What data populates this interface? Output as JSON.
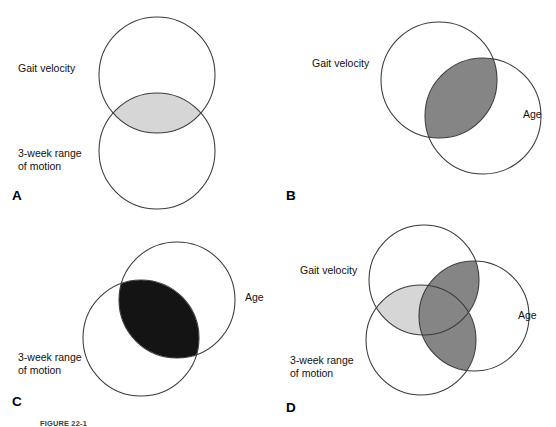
{
  "figure": {
    "caption": "FIGURE 22-1",
    "background_color": "#ffffff",
    "stroke_color": "#3a3a3a"
  },
  "labels": {
    "gait_velocity": "Gait velocity",
    "three_week_rom_line1": "3-week range",
    "three_week_rom_line2": "of motion",
    "age": "Age"
  },
  "colors": {
    "light_gray": "#d6d6d6",
    "medium_gray": "#858585",
    "black": "#141414",
    "outline": "#3a3a3a"
  },
  "panels": [
    {
      "id": "A",
      "letter": "A",
      "letter_x": 12,
      "letter_y": 200,
      "circles": [
        {
          "name": "gait-velocity-circle",
          "cx": 157,
          "cy": 75,
          "r": 58
        },
        {
          "name": "three-week-rom-circle",
          "cx": 157,
          "cy": 151,
          "r": 58
        }
      ],
      "shaded": [
        {
          "name": "gait-rom-intersection",
          "fill": "#d6d6d6"
        }
      ],
      "texts": [
        {
          "name": "gait-velocity-label",
          "key": "gait_velocity",
          "x": 18,
          "y": 72,
          "anchor": "start"
        },
        {
          "name": "three-week-rom-label-line1",
          "key": "three_week_rom_line1",
          "x": 18,
          "y": 157,
          "anchor": "start"
        },
        {
          "name": "three-week-rom-label-line2",
          "key": "three_week_rom_line2",
          "x": 18,
          "y": 170,
          "anchor": "start"
        }
      ]
    },
    {
      "id": "B",
      "letter": "B",
      "letter_x": 8,
      "letter_y": 200,
      "circles": [
        {
          "name": "gait-velocity-circle",
          "cx": 161,
          "cy": 80,
          "r": 58
        },
        {
          "name": "age-circle",
          "cx": 205,
          "cy": 116,
          "r": 58
        }
      ],
      "shaded": [
        {
          "name": "gait-age-intersection",
          "fill": "#858585"
        }
      ],
      "texts": [
        {
          "name": "gait-velocity-label",
          "key": "gait_velocity",
          "x": 34,
          "y": 67,
          "anchor": "start"
        },
        {
          "name": "age-label",
          "key": "age",
          "x": 245,
          "y": 118,
          "anchor": "start"
        }
      ]
    },
    {
      "id": "C",
      "letter": "C",
      "letter_x": 12,
      "letter_y": 193,
      "circles": [
        {
          "name": "age-circle",
          "cx": 177,
          "cy": 87,
          "r": 58
        },
        {
          "name": "three-week-rom-circle",
          "cx": 141,
          "cy": 125,
          "r": 58
        }
      ],
      "shaded": [
        {
          "name": "age-rom-intersection",
          "fill": "#141414"
        }
      ],
      "texts": [
        {
          "name": "age-label",
          "key": "age",
          "x": 245,
          "y": 88,
          "anchor": "start"
        },
        {
          "name": "three-week-rom-label-line1",
          "key": "three_week_rom_line1",
          "x": 18,
          "y": 148,
          "anchor": "start"
        },
        {
          "name": "three-week-rom-label-line2",
          "key": "three_week_rom_line2",
          "x": 18,
          "y": 161,
          "anchor": "start"
        }
      ]
    },
    {
      "id": "D",
      "letter": "D",
      "letter_x": 8,
      "letter_y": 199,
      "circles": [
        {
          "name": "gait-velocity-circle",
          "cx": 146,
          "cy": 67,
          "r": 55
        },
        {
          "name": "age-circle",
          "cx": 196,
          "cy": 103,
          "r": 55
        },
        {
          "name": "three-week-rom-circle",
          "cx": 143,
          "cy": 127,
          "r": 55
        }
      ],
      "shaded": [
        {
          "name": "gait-age-intersection",
          "fill": "#858585"
        },
        {
          "name": "age-rom-intersection",
          "fill": "#858585"
        },
        {
          "name": "gait-rom-intersection",
          "fill": "#d6d6d6"
        }
      ],
      "texts": [
        {
          "name": "gait-velocity-label",
          "key": "gait_velocity",
          "x": 22,
          "y": 61,
          "anchor": "start"
        },
        {
          "name": "age-label",
          "key": "age",
          "x": 240,
          "y": 106,
          "anchor": "start"
        },
        {
          "name": "three-week-rom-label-line1",
          "key": "three_week_rom_line1",
          "x": 12,
          "y": 151,
          "anchor": "start"
        },
        {
          "name": "three-week-rom-label-line2",
          "key": "three_week_rom_line2",
          "x": 12,
          "y": 164,
          "anchor": "start"
        }
      ]
    }
  ]
}
